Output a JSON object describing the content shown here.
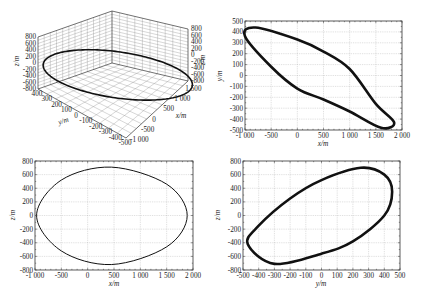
{
  "figure": {
    "panels": 4,
    "colors": {
      "curve": "#111111",
      "frame": "#333333",
      "grid": "#9a9a9a",
      "background": "#ffffff"
    }
  },
  "chart_data": [
    {
      "id": "panel-3d",
      "type": "line3d",
      "title": "",
      "xlabel": "x/m",
      "ylabel": "y/m",
      "zlabel": "z/m",
      "xticks": [
        "-1 000",
        "-500",
        "0",
        "500",
        "1 000",
        "1 500"
      ],
      "yticks": [
        "400",
        "300",
        "200",
        "100",
        "0",
        "-100",
        "-200",
        "-300",
        "-400",
        "-500"
      ],
      "zticks_left": [
        "800",
        "600",
        "400",
        "200",
        "0",
        "-200",
        "-400",
        "-600",
        "-800"
      ],
      "zticks_right": [
        "800",
        "600",
        "400",
        "200",
        "0",
        "-200",
        "-400",
        "-600",
        "-800"
      ],
      "xlim": [
        -1000,
        2000
      ],
      "ylim": [
        -500,
        500
      ],
      "zlim": [
        -800,
        800
      ],
      "series": [
        {
          "name": "orbit",
          "center": {
            "x": 450,
            "y": 0,
            "z": 0
          },
          "semi_axes": {
            "x": 1420,
            "y": 450,
            "z": 715
          }
        }
      ],
      "grid": true
    },
    {
      "id": "panel-xy",
      "type": "line",
      "title": "",
      "xlabel": "x/m",
      "ylabel": "y/m",
      "xticks": [
        "-1 000",
        "-500",
        "0",
        "500",
        "1 000",
        "1 500",
        "2 000"
      ],
      "yticks": [
        "500",
        "400",
        "300",
        "200",
        "100",
        "0",
        "-100",
        "-200",
        "-300",
        "-400",
        "-500"
      ],
      "xlim": [
        -1000,
        2000
      ],
      "ylim": [
        -500,
        500
      ],
      "series": [
        {
          "name": "x-y projection",
          "points": [
            [
              -1000,
              360
            ],
            [
              -800,
              440
            ],
            [
              0,
              330
            ],
            [
              500,
              220
            ],
            [
              1000,
              60
            ],
            [
              1500,
              -260
            ],
            [
              1850,
              -430
            ],
            [
              1600,
              -480
            ],
            [
              1000,
              -330
            ],
            [
              500,
              -220
            ],
            [
              0,
              -120
            ],
            [
              -500,
              80
            ],
            [
              -1000,
              360
            ]
          ]
        }
      ],
      "grid": true
    },
    {
      "id": "panel-xz",
      "type": "line",
      "title": "",
      "xlabel": "x/m",
      "ylabel": "z/m",
      "xticks": [
        "-1 000",
        "-500",
        "0",
        "500",
        "1 000",
        "1 500",
        "2 000"
      ],
      "yticks": [
        "800",
        "600",
        "400",
        "200",
        "0",
        "-200",
        "-400",
        "-600",
        "-800"
      ],
      "xlim": [
        -1000,
        2000
      ],
      "ylim": [
        -800,
        800
      ],
      "series": [
        {
          "name": "x-z projection",
          "points": [
            [
              -970,
              0
            ],
            [
              -500,
              520
            ],
            [
              450,
              710
            ],
            [
              1500,
              460
            ],
            [
              1890,
              0
            ],
            [
              1500,
              -460
            ],
            [
              450,
              -720
            ],
            [
              -500,
              -520
            ],
            [
              -970,
              0
            ]
          ]
        }
      ],
      "grid": true
    },
    {
      "id": "panel-yz",
      "type": "line",
      "title": "",
      "xlabel": "y/m",
      "ylabel": "z/m",
      "xticks": [
        "-500",
        "-400",
        "-300",
        "-200",
        "-100",
        "0",
        "100",
        "200",
        "300",
        "400",
        "500"
      ],
      "yticks": [
        "800",
        "600",
        "400",
        "200",
        "0",
        "-200",
        "-400",
        "-600",
        "-800"
      ],
      "xlim": [
        -500,
        500
      ],
      "ylim": [
        -800,
        800
      ],
      "series": [
        {
          "name": "y-z projection",
          "points": [
            [
              -470,
              -420
            ],
            [
              -400,
              -150
            ],
            [
              -200,
              250
            ],
            [
              0,
              520
            ],
            [
              250,
              700
            ],
            [
              400,
              600
            ],
            [
              450,
              350
            ],
            [
              400,
              0
            ],
            [
              200,
              -380
            ],
            [
              0,
              -560
            ],
            [
              -300,
              -710
            ],
            [
              -470,
              -420
            ]
          ]
        }
      ],
      "grid": true
    }
  ]
}
